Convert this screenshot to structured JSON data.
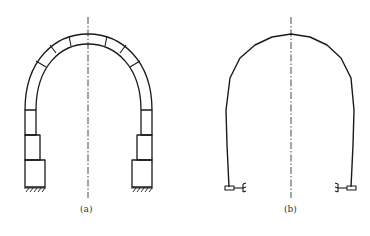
{
  "figures": [
    {
      "id": "a",
      "caption": "(a)",
      "description": "Segmented masonry arch with stepped block columns on fixed supports"
    },
    {
      "id": "b",
      "caption": "(b)",
      "description": "Line model of arch with elastic/fixed supports at both feet"
    }
  ],
  "colors": {
    "line": "#1a1a1a",
    "background": "#ffffff"
  }
}
